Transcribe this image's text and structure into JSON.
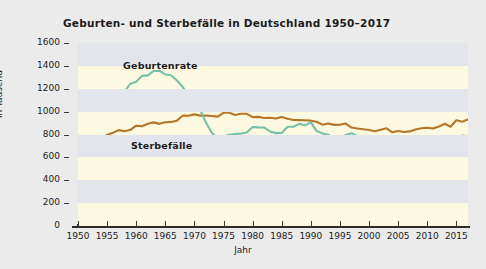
{
  "chart_data": {
    "type": "line",
    "title": "Geburten- und Sterbefälle in Deutschland 1950–2017",
    "xlabel": "Jahr",
    "ylabel": "in Tausend",
    "xlim": [
      1950,
      2017
    ],
    "ylim": [
      0,
      1600
    ],
    "yticks": [
      0,
      200,
      400,
      600,
      800,
      1000,
      1200,
      1400,
      1600
    ],
    "xticks": [
      1950,
      1955,
      1960,
      1965,
      1970,
      1975,
      1980,
      1985,
      1990,
      1995,
      2000,
      2005,
      2010,
      2015
    ],
    "grid": "horizontal-bands",
    "legend": "inline-annotations",
    "x": [
      1950,
      1951,
      1952,
      1953,
      1954,
      1955,
      1956,
      1957,
      1958,
      1959,
      1960,
      1961,
      1962,
      1963,
      1964,
      1965,
      1966,
      1967,
      1968,
      1969,
      1970,
      1971,
      1972,
      1973,
      1974,
      1975,
      1976,
      1977,
      1978,
      1979,
      1980,
      1981,
      1982,
      1983,
      1984,
      1985,
      1986,
      1987,
      1988,
      1989,
      1990,
      1991,
      1992,
      1993,
      1994,
      1995,
      1996,
      1997,
      1998,
      1999,
      2000,
      2001,
      2002,
      2003,
      2004,
      2005,
      2006,
      2007,
      2008,
      2009,
      2010,
      2011,
      2012,
      2013,
      2014,
      2015,
      2016,
      2017
    ],
    "series": [
      {
        "name": "Geburtenrate",
        "color": "#76c2a8",
        "values": [
          1116,
          1106,
          1105,
          1095,
          1100,
          1096,
          1115,
          1150,
          1177,
          1244,
          1262,
          1313,
          1317,
          1355,
          1357,
          1325,
          1318,
          1272,
          1215,
          1142,
          1048,
          1014,
          902,
          815,
          757,
          783,
          798,
          805,
          808,
          818,
          866,
          862,
          861,
          827,
          812,
          813,
          868,
          868,
          893,
          880,
          906,
          830,
          809,
          798,
          769,
          765,
          796,
          812,
          785,
          771,
          767,
          734,
          719,
          707,
          706,
          686,
          673,
          685,
          683,
          665,
          678,
          663,
          674,
          682,
          715,
          738,
          792,
          785
        ]
      },
      {
        "name": "Sterbefälle",
        "color": "#b5762a",
        "values": [
          748,
          757,
          766,
          780,
          767,
          796,
          815,
          838,
          829,
          841,
          877,
          872,
          894,
          906,
          893,
          907,
          910,
          921,
          966,
          964,
          976,
          965,
          966,
          962,
          956,
          990,
          990,
          971,
          981,
          981,
          952,
          954,
          944,
          947,
          940,
          954,
          938,
          927,
          926,
          924,
          921,
          911,
          886,
          897,
          884,
          885,
          896,
          861,
          852,
          846,
          839,
          829,
          842,
          854,
          819,
          830,
          822,
          827,
          844,
          855,
          859,
          852,
          869,
          894,
          868,
          925,
          911,
          932
        ]
      }
    ]
  }
}
